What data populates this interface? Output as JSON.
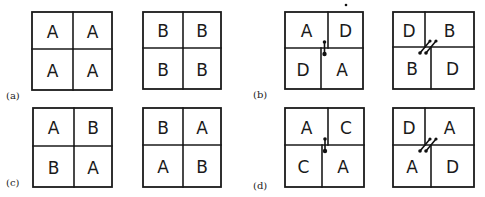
{
  "figure": {
    "panels": [
      {
        "id": "a",
        "label": "(a)",
        "label_pos": [
          6,
          99
        ],
        "boxes": [
          {
            "x": 32,
            "y": 12,
            "w": 80,
            "h": 78,
            "vx_top": 73,
            "vx_bot": 73,
            "hy": 49,
            "defect": "none",
            "cells": [
              "A",
              "A",
              "A",
              "A"
            ]
          },
          {
            "x": 143,
            "y": 12,
            "w": 78,
            "h": 77,
            "vx_top": 183,
            "vx_bot": 183,
            "hy": 48,
            "defect": "none",
            "cells": [
              "B",
              "B",
              "B",
              "B"
            ]
          }
        ]
      },
      {
        "id": "b",
        "label": "(b)",
        "label_pos": [
          253,
          98
        ],
        "boxes": [
          {
            "x": 285,
            "y": 12,
            "w": 78,
            "h": 77,
            "vx_top": 328,
            "vx_bot": 321,
            "hy": 48,
            "defect": "single",
            "cells": [
              "A",
              "D",
              "D",
              "A"
            ]
          },
          {
            "x": 393,
            "y": 12,
            "w": 81,
            "h": 77,
            "vx_top": 425,
            "vx_bot": 431,
            "hy": 47,
            "defect": "double",
            "cells": [
              "D",
              "B",
              "B",
              "D"
            ]
          }
        ],
        "extra_dot": [
          346,
          5
        ]
      },
      {
        "id": "c",
        "label": "(c)",
        "label_pos": [
          6,
          186
        ],
        "boxes": [
          {
            "x": 33,
            "y": 108,
            "w": 79,
            "h": 79,
            "vx_top": 74,
            "vx_bot": 74,
            "hy": 146,
            "defect": "none",
            "cells": [
              "A",
              "B",
              "B",
              "A"
            ]
          },
          {
            "x": 143,
            "y": 108,
            "w": 78,
            "h": 79,
            "vx_top": 183,
            "vx_bot": 183,
            "hy": 145,
            "defect": "none",
            "cells": [
              "B",
              "A",
              "A",
              "B"
            ]
          }
        ]
      },
      {
        "id": "d",
        "label": "(d)",
        "label_pos": [
          253,
          189
        ],
        "boxes": [
          {
            "x": 285,
            "y": 108,
            "w": 79,
            "h": 79,
            "vx_top": 328,
            "vx_bot": 322,
            "hy": 145,
            "defect": "single",
            "cells": [
              "A",
              "C",
              "C",
              "A"
            ]
          },
          {
            "x": 393,
            "y": 108,
            "w": 81,
            "h": 79,
            "vx_top": 425,
            "vx_bot": 431,
            "hy": 145,
            "defect": "double",
            "cells": [
              "D",
              "A",
              "A",
              "D"
            ]
          }
        ]
      }
    ]
  }
}
